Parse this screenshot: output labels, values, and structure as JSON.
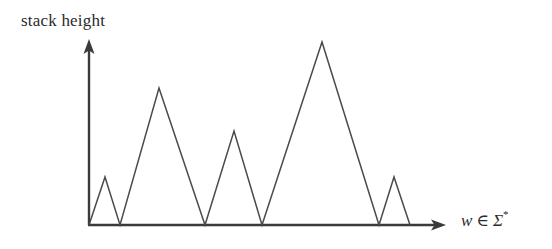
{
  "figure": {
    "y_axis_label": "stack height",
    "x_axis_label_parts": {
      "variable": "w",
      "operator": "∈",
      "alphabet": "Σ",
      "star": "*"
    },
    "x_axis_label_full": "w ∈ Σ*",
    "line_color": "#4a4a4a",
    "axis_color": "#3a3a3a",
    "background_color": "#ffffff"
  },
  "chart_data": {
    "type": "line",
    "title": "",
    "subtitle": "",
    "xlabel": "w ∈ Σ*",
    "ylabel": "stack height",
    "grid": false,
    "legend": null,
    "axis_arrows": {
      "x": "right",
      "y": "up"
    },
    "tick_labels": {
      "x": [],
      "y": []
    },
    "xlim": [
      0,
      100
    ],
    "ylim": [
      0,
      100
    ],
    "series": [
      {
        "name": "stack height over input",
        "x": [
          0,
          5,
          10,
          22,
          36,
          45,
          54,
          73,
          91,
          95,
          100
        ],
        "y": [
          0,
          26,
          0,
          75,
          0,
          51,
          0,
          100,
          0,
          26,
          0
        ]
      }
    ],
    "pixel_polyline": [
      [
        89,
        225
      ],
      [
        105,
        177
      ],
      [
        120,
        225
      ],
      [
        159,
        88
      ],
      [
        205,
        225
      ],
      [
        234,
        131
      ],
      [
        262,
        225
      ],
      [
        322,
        42
      ],
      [
        379,
        225
      ],
      [
        394,
        177
      ],
      [
        410,
        225
      ]
    ],
    "peaks_px": [
      [
        105,
        177
      ],
      [
        159,
        88
      ],
      [
        234,
        131
      ],
      [
        322,
        42
      ],
      [
        394,
        177
      ]
    ],
    "valleys_px": [
      [
        89,
        225
      ],
      [
        120,
        225
      ],
      [
        205,
        225
      ],
      [
        262,
        225
      ],
      [
        379,
        225
      ],
      [
        410,
        225
      ]
    ],
    "axes_px": {
      "origin": [
        89,
        225
      ],
      "y_axis_top": [
        89,
        40
      ],
      "x_axis_end": [
        445,
        225
      ]
    }
  }
}
